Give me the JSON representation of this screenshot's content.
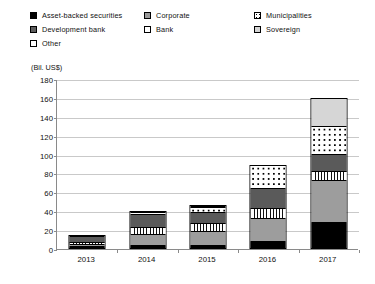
{
  "chart_data": {
    "type": "bar",
    "subtype": "stacked-column",
    "title": "",
    "xlabel": "",
    "ylabel": "(Bil. US$)",
    "ylim": [
      0,
      180
    ],
    "ytick_step": 20,
    "yticks": [
      180,
      160,
      140,
      120,
      100,
      80,
      60,
      40,
      20,
      0
    ],
    "grid": true,
    "legend_position": "top",
    "categories": [
      "2013",
      "2014",
      "2015",
      "2016",
      "2017"
    ],
    "series": [
      {
        "name": "Asset-backed securities",
        "key": "asset",
        "fill": "black",
        "values": [
          1,
          2,
          2,
          6,
          26
        ]
      },
      {
        "name": "Corporate",
        "key": "corp",
        "fill": "medium-gray",
        "values": [
          2,
          12,
          15,
          25,
          45
        ]
      },
      {
        "name": "Bank",
        "key": "bank",
        "fill": "vertical-stripes",
        "values": [
          2,
          7,
          8,
          10,
          10
        ]
      },
      {
        "name": "Development bank",
        "key": "devbank",
        "fill": "dark-gray",
        "values": [
          7,
          14,
          12,
          21,
          17
        ]
      },
      {
        "name": "Municipalities",
        "key": "muni",
        "fill": "dotted",
        "values": [
          1,
          2,
          6,
          25,
          30
        ]
      },
      {
        "name": "Sovereign",
        "key": "sov",
        "fill": "light-gray",
        "values": [
          0,
          1,
          1,
          0,
          30
        ]
      },
      {
        "name": "Other",
        "key": "other",
        "fill": "white",
        "values": [
          0,
          0,
          1,
          0,
          0
        ]
      }
    ],
    "totals": [
      13,
      38,
      45,
      87,
      158
    ]
  },
  "legend": {
    "items": [
      {
        "label": "Asset-backed securities",
        "swatch": "asset-swatch-icon"
      },
      {
        "label": "Corporate",
        "swatch": "corporate-swatch-icon"
      },
      {
        "label": "Municipalities",
        "swatch": "municipalities-swatch-icon"
      },
      {
        "label": "Development bank",
        "swatch": "development-bank-swatch-icon"
      },
      {
        "label": "Bank",
        "swatch": "bank-swatch-icon"
      },
      {
        "label": "Sovereign",
        "swatch": "sovereign-swatch-icon"
      },
      {
        "label": "Other",
        "swatch": "other-swatch-icon"
      }
    ]
  },
  "axis": {
    "unit_label": "(Bil. US$)"
  },
  "colors": {
    "asset": "#000000",
    "corporate": "#9d9d9d",
    "development_bank": "#5a5a5a",
    "sovereign": "#d6d6d6",
    "other": "#ffffff",
    "grid": "#c9c9c9",
    "axis": "#8a8a8a",
    "text": "#111111"
  }
}
